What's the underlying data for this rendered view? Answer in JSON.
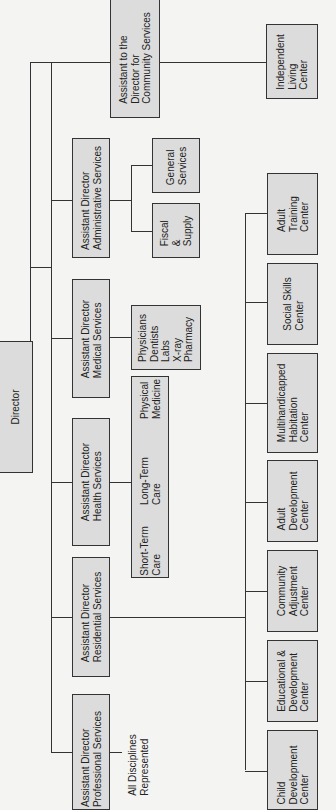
{
  "director": {
    "label": "Director"
  },
  "divisions": {
    "community": {
      "label": "Assistant to the\nDirector for\nCommunity Services"
    },
    "administrative": {
      "label": "Assistant Director\nAdministrative Services"
    },
    "medical": {
      "label": "Assistant Director\nMedical Services"
    },
    "health": {
      "label": "Assistant Director\nHealth Services"
    },
    "residential": {
      "label": "Assistant Director\nResidential Services"
    },
    "professional": {
      "label": "Assistant Director\nProfessional Services"
    }
  },
  "units": {
    "independent_living": "Independent\nLiving\nCenter",
    "general_services": "General\nServices",
    "fiscal_supply": "Fiscal\n&\nSupply",
    "physicians": "Physicians\nDentists\nLabs\nX-ray\nPharmacy",
    "health_care": {
      "short_term": "Short-Term\nCare",
      "long_term": "Long-Term\nCare",
      "physical_medicine": "Physical\nMedicine"
    },
    "all_disciplines": "All Disciplines\nRepresented"
  },
  "residential_centers": [
    "Adult\nTraining\nCenter",
    "Social Skills\nCenter",
    "Multihandicapped\nHabitation\nCenter",
    "Adult\nDevelopment\nCenter",
    "Community\nAdjustment\nCenter",
    "Educational &\nDevelopment\nCenter",
    "Child\nDevelopment\nCenter"
  ]
}
